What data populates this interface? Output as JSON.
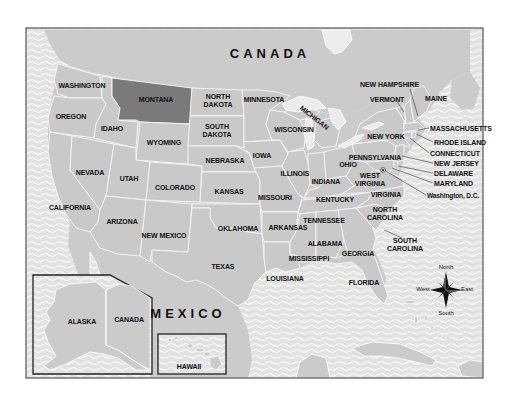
{
  "map": {
    "title": "United States",
    "highlighted_state": "MONTANA",
    "colors": {
      "ocean": "#e4e4e4",
      "land": "#c9c9c9",
      "highlight": "#7a7a7a",
      "border": "#f4f4f4",
      "frame": "#444444",
      "text": "#111111"
    },
    "countries": {
      "canada": "CANADA",
      "mexico": "MEXICO"
    },
    "states": {
      "washington": "WASHINGTON",
      "oregon": "OREGON",
      "california": "CALIFORNIA",
      "nevada": "NEVADA",
      "idaho": "IDAHO",
      "montana": "MONTANA",
      "wyoming": "WYOMING",
      "utah": "UTAH",
      "arizona": "ARIZONA",
      "colorado": "COLORADO",
      "new_mexico": "NEW MEXICO",
      "north_dakota_1": "NORTH",
      "north_dakota_2": "DAKOTA",
      "south_dakota_1": "SOUTH",
      "south_dakota_2": "DAKOTA",
      "nebraska": "NEBRASKA",
      "kansas": "KANSAS",
      "oklahoma": "OKLAHOMA",
      "texas": "TEXAS",
      "minnesota": "MINNESOTA",
      "iowa": "IOWA",
      "missouri": "MISSOURI",
      "arkansas": "ARKANSAS",
      "louisiana": "LOUISIANA",
      "wisconsin": "WISCONSIN",
      "illinois": "ILLINOIS",
      "michigan": "MICHIGAN",
      "indiana": "INDIANA",
      "ohio": "OHIO",
      "kentucky": "KENTUCKY",
      "tennessee": "TENNESSEE",
      "mississippi": "MISSISSIPPI",
      "alabama": "ALABAMA",
      "georgia": "GEORGIA",
      "florida": "FLORIDA",
      "south_carolina_1": "SOUTH",
      "south_carolina_2": "CAROLINA",
      "north_carolina_1": "NORTH",
      "north_carolina_2": "CAROLINA",
      "virginia": "VIRGINIA",
      "west_virginia_1": "WEST",
      "west_virginia_2": "VIRGINIA",
      "pennsylvania": "PENNSYLVANIA",
      "new_york": "NEW YORK",
      "vermont": "VERMONT",
      "new_hampshire": "NEW HAMPSHIRE",
      "maine": "MAINE",
      "massachusetts": "MASSACHUSETTS",
      "rhode_island": "RHODE ISLAND",
      "connecticut": "CONNECTICUT",
      "new_jersey": "NEW JERSEY",
      "delaware": "DELAWARE",
      "maryland": "MARYLAND",
      "alaska": "ALASKA",
      "hawaii": "HAWAII"
    },
    "capital": "Washington, D.C.",
    "inset_alaska": {
      "label_state": "ALASKA",
      "label_country": "CANADA"
    },
    "inset_hawaii": {
      "label": "HAWAII"
    },
    "compass": {
      "north": "North",
      "south": "South",
      "east": "East",
      "west": "West"
    }
  }
}
